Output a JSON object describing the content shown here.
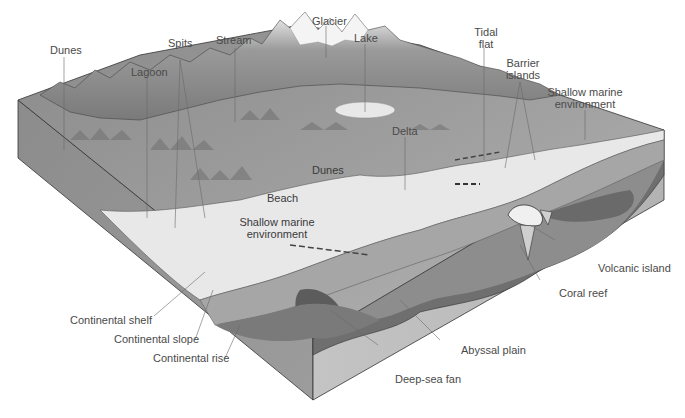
{
  "diagram": {
    "labels": {
      "dunes_inland": "Dunes",
      "lagoon": "Lagoon",
      "spits": "Spits",
      "stream": "Stream",
      "glacier": "Glacier",
      "lake": "Lake",
      "tidal_flat_line1": "Tidal",
      "tidal_flat_line2": "flat",
      "barrier_islands_line1": "Barrier",
      "barrier_islands_line2": "islands",
      "shallow_marine_right_line1": "Shallow marine",
      "shallow_marine_right_line2": "environment",
      "delta": "Delta",
      "dunes_coastal": "Dunes",
      "beach": "Beach",
      "shallow_marine_center_line1": "Shallow marine",
      "shallow_marine_center_line2": "environment",
      "continental_shelf": "Continental shelf",
      "continental_slope": "Continental slope",
      "continental_rise": "Continental rise",
      "volcanic_island": "Volcanic island",
      "coral_reef": "Coral reef",
      "abyssal_plain": "Abyssal plain",
      "deep_sea_fan": "Deep-sea fan"
    },
    "colors": {
      "land": "#9a9a9a",
      "land_light": "#b5b5b5",
      "mountain_dark": "#5e5e5e",
      "snow": "#f2f2f2",
      "shallow_water": "#e6e6e6",
      "slope": "#a8a8a8",
      "deep_floor": "#7c7c7c",
      "fan_dark": "#5a5a5a",
      "block_side_left": "#8e8e8e",
      "block_side_front": "#bdbdbd",
      "leader_line": "#6a6a6a"
    }
  }
}
